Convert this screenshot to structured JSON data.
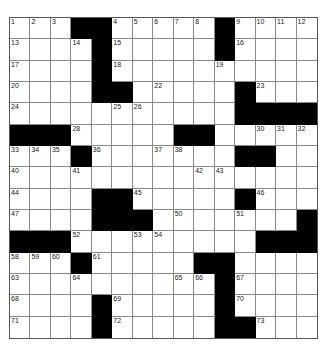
{
  "puzzle": {
    "rows": 15,
    "cols": 15,
    "colors": {
      "black": "#000000",
      "white": "#ffffff",
      "grid_line": "#8a8a8a"
    },
    "layout": [
      "...##.....#....",
      "....#.....#....",
      "....#..........",
      "....##.....#...",
      "...........####",
      "###.....##.....",
      "...#.......##..",
      "...............",
      "....##.....#...",
      "....###.......#",
      "###.........###",
      "...#.....##....",
      "..........#....",
      "....#.....#....",
      "....#.....##..."
    ],
    "numbers": [
      {
        "r": 0,
        "c": 0,
        "n": "1"
      },
      {
        "r": 0,
        "c": 1,
        "n": "2"
      },
      {
        "r": 0,
        "c": 2,
        "n": "3"
      },
      {
        "r": 0,
        "c": 5,
        "n": "4"
      },
      {
        "r": 0,
        "c": 6,
        "n": "5"
      },
      {
        "r": 0,
        "c": 7,
        "n": "6"
      },
      {
        "r": 0,
        "c": 8,
        "n": "7"
      },
      {
        "r": 0,
        "c": 9,
        "n": "8"
      },
      {
        "r": 0,
        "c": 11,
        "n": "9"
      },
      {
        "r": 0,
        "c": 12,
        "n": "10"
      },
      {
        "r": 0,
        "c": 13,
        "n": "11"
      },
      {
        "r": 0,
        "c": 14,
        "n": "12"
      },
      {
        "r": 1,
        "c": 0,
        "n": "13"
      },
      {
        "r": 1,
        "c": 3,
        "n": "14"
      },
      {
        "r": 1,
        "c": 5,
        "n": "15"
      },
      {
        "r": 1,
        "c": 11,
        "n": "16"
      },
      {
        "r": 2,
        "c": 0,
        "n": "17"
      },
      {
        "r": 2,
        "c": 5,
        "n": "18"
      },
      {
        "r": 2,
        "c": 10,
        "n": "19"
      },
      {
        "r": 3,
        "c": 0,
        "n": "20"
      },
      {
        "r": 3,
        "c": 4,
        "n": "21"
      },
      {
        "r": 3,
        "c": 7,
        "n": "22"
      },
      {
        "r": 3,
        "c": 12,
        "n": "23"
      },
      {
        "r": 4,
        "c": 0,
        "n": "24"
      },
      {
        "r": 4,
        "c": 5,
        "n": "25"
      },
      {
        "r": 4,
        "c": 6,
        "n": "26"
      },
      {
        "r": 4,
        "c": 11,
        "n": "27"
      },
      {
        "r": 5,
        "c": 3,
        "n": "28"
      },
      {
        "r": 5,
        "c": 9,
        "n": "29"
      },
      {
        "r": 5,
        "c": 12,
        "n": "30"
      },
      {
        "r": 5,
        "c": 13,
        "n": "31"
      },
      {
        "r": 5,
        "c": 14,
        "n": "32"
      },
      {
        "r": 6,
        "c": 0,
        "n": "33"
      },
      {
        "r": 6,
        "c": 1,
        "n": "34"
      },
      {
        "r": 6,
        "c": 2,
        "n": "35"
      },
      {
        "r": 6,
        "c": 4,
        "n": "36"
      },
      {
        "r": 6,
        "c": 7,
        "n": "37"
      },
      {
        "r": 6,
        "c": 8,
        "n": "38"
      },
      {
        "r": 6,
        "c": 11,
        "n": "39"
      },
      {
        "r": 7,
        "c": 0,
        "n": "40"
      },
      {
        "r": 7,
        "c": 3,
        "n": "41"
      },
      {
        "r": 7,
        "c": 9,
        "n": "42"
      },
      {
        "r": 7,
        "c": 10,
        "n": "43"
      },
      {
        "r": 8,
        "c": 0,
        "n": "44"
      },
      {
        "r": 8,
        "c": 6,
        "n": "45"
      },
      {
        "r": 8,
        "c": 12,
        "n": "46"
      },
      {
        "r": 9,
        "c": 0,
        "n": "47"
      },
      {
        "r": 9,
        "c": 4,
        "n": "48"
      },
      {
        "r": 9,
        "c": 5,
        "n": "49"
      },
      {
        "r": 9,
        "c": 8,
        "n": "50"
      },
      {
        "r": 9,
        "c": 11,
        "n": "51"
      },
      {
        "r": 10,
        "c": 3,
        "n": "52"
      },
      {
        "r": 10,
        "c": 6,
        "n": "53"
      },
      {
        "r": 10,
        "c": 7,
        "n": "54"
      },
      {
        "r": 10,
        "c": 12,
        "n": "55"
      },
      {
        "r": 10,
        "c": 13,
        "n": "56"
      },
      {
        "r": 10,
        "c": 14,
        "n": "57"
      },
      {
        "r": 11,
        "c": 0,
        "n": "58"
      },
      {
        "r": 11,
        "c": 1,
        "n": "59"
      },
      {
        "r": 11,
        "c": 2,
        "n": "60"
      },
      {
        "r": 11,
        "c": 4,
        "n": "61"
      },
      {
        "r": 11,
        "c": 10,
        "n": "62"
      },
      {
        "r": 12,
        "c": 0,
        "n": "63"
      },
      {
        "r": 12,
        "c": 3,
        "n": "64"
      },
      {
        "r": 12,
        "c": 8,
        "n": "65"
      },
      {
        "r": 12,
        "c": 9,
        "n": "66"
      },
      {
        "r": 12,
        "c": 11,
        "n": "67"
      },
      {
        "r": 13,
        "c": 0,
        "n": "68"
      },
      {
        "r": 13,
        "c": 5,
        "n": "69"
      },
      {
        "r": 13,
        "c": 11,
        "n": "70"
      },
      {
        "r": 14,
        "c": 0,
        "n": "71"
      },
      {
        "r": 14,
        "c": 5,
        "n": "72"
      },
      {
        "r": 14,
        "c": 12,
        "n": "73"
      }
    ]
  }
}
